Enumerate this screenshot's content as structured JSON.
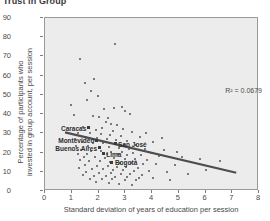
{
  "chart_title": "Trust in Group",
  "axes": {
    "x_label": "Standard deviation of years of education per session",
    "y_label_line1": "Percentage of participants who",
    "y_label_line2": "invested in group account, per session",
    "x_ticks": [
      "0",
      "1",
      "2",
      "3",
      "4",
      "5",
      "6",
      "7",
      "8"
    ],
    "y_ticks": [
      "0",
      "10",
      "20",
      "30",
      "40",
      "50",
      "60",
      "70",
      "80",
      "90"
    ]
  },
  "annotation": {
    "r_squared": "R² = 0.0679"
  },
  "cities": [
    {
      "name": "Caracas",
      "label_side": "left",
      "x": 1.62,
      "y": 33.0
    },
    {
      "name": "Montevideo",
      "label_side": "left",
      "x": 1.92,
      "y": 26.5
    },
    {
      "name": "San José",
      "label_side": "right",
      "x": 2.62,
      "y": 24.5
    },
    {
      "name": "Buenos Aires",
      "label_side": "left",
      "x": 2.02,
      "y": 22.5
    },
    {
      "name": "Lima",
      "label_side": "right",
      "x": 2.18,
      "y": 19.5
    },
    {
      "name": "Bogotá",
      "label_side": "right",
      "x": 2.5,
      "y": 15.0
    }
  ],
  "colors": {
    "plot_background": "#ececec",
    "plot_border": "#9a9a9a",
    "dot": "#555555",
    "trend_line": "#4d4d4d",
    "text": "#4a4a4a",
    "title_text": "#3a3a3a"
  },
  "chart_data": {
    "type": "scatter",
    "title": "Trust in Group",
    "xlabel": "Standard deviation of years of education per session",
    "ylabel": "Percentage of participants who invested in group account, per session",
    "xlim": [
      0,
      8
    ],
    "ylim": [
      0,
      90
    ],
    "x_ticks": [
      0,
      1,
      2,
      3,
      4,
      5,
      6,
      7,
      8
    ],
    "y_ticks": [
      0,
      10,
      20,
      30,
      40,
      50,
      60,
      70,
      80,
      90
    ],
    "grid": false,
    "legend": "none",
    "r_squared": 0.0679,
    "trendline": {
      "type": "linear",
      "x_start": 0.75,
      "y_start": 30.5,
      "x_end": 7.15,
      "y_end": 9.5
    },
    "points": [
      [
        2.62,
        76.5
      ],
      [
        1.32,
        68.5
      ],
      [
        1.85,
        58.5
      ],
      [
        1.48,
        56.0
      ],
      [
        1.72,
        52.0
      ],
      [
        1.98,
        49.5
      ],
      [
        1.58,
        47.5
      ],
      [
        0.96,
        45.0
      ],
      [
        2.58,
        43.0
      ],
      [
        2.22,
        42.5
      ],
      [
        2.98,
        41.5
      ],
      [
        3.18,
        40.0
      ],
      [
        1.08,
        39.5
      ],
      [
        1.78,
        39.0
      ],
      [
        2.02,
        38.5
      ],
      [
        2.35,
        38.0
      ],
      [
        2.28,
        36.0
      ],
      [
        2.45,
        35.0
      ],
      [
        1.62,
        33.0
      ],
      [
        2.7,
        34.5
      ],
      [
        1.42,
        33.5
      ],
      [
        2.12,
        33.0
      ],
      [
        2.92,
        32.0
      ],
      [
        1.9,
        31.5
      ],
      [
        2.55,
        31.0
      ],
      [
        3.25,
        30.5
      ],
      [
        1.25,
        30.0
      ],
      [
        1.68,
        30.0
      ],
      [
        2.08,
        29.5
      ],
      [
        2.42,
        29.0
      ],
      [
        2.85,
        28.5
      ],
      [
        3.55,
        28.0
      ],
      [
        1.52,
        28.0
      ],
      [
        1.95,
        27.5
      ],
      [
        2.32,
        27.0
      ],
      [
        1.92,
        26.5
      ],
      [
        2.65,
        26.5
      ],
      [
        3.05,
        26.0
      ],
      [
        4.02,
        25.5
      ],
      [
        1.38,
        25.5
      ],
      [
        1.8,
        25.0
      ],
      [
        2.18,
        25.0
      ],
      [
        2.62,
        24.5
      ],
      [
        2.95,
        24.0
      ],
      [
        3.42,
        24.0
      ],
      [
        1.15,
        23.5
      ],
      [
        1.6,
        23.5
      ],
      [
        2.02,
        22.5
      ],
      [
        2.38,
        23.0
      ],
      [
        2.78,
        22.5
      ],
      [
        3.15,
        22.0
      ],
      [
        3.72,
        22.0
      ],
      [
        4.45,
        21.5
      ],
      [
        1.35,
        21.5
      ],
      [
        1.72,
        21.0
      ],
      [
        2.1,
        21.0
      ],
      [
        2.48,
        20.5
      ],
      [
        2.88,
        20.5
      ],
      [
        3.28,
        20.0
      ],
      [
        3.95,
        20.0
      ],
      [
        1.22,
        19.5
      ],
      [
        1.58,
        19.5
      ],
      [
        2.18,
        19.5
      ],
      [
        2.3,
        19.0
      ],
      [
        2.72,
        19.0
      ],
      [
        3.08,
        18.5
      ],
      [
        3.58,
        18.5
      ],
      [
        4.28,
        18.0
      ],
      [
        5.12,
        17.5
      ],
      [
        1.45,
        17.5
      ],
      [
        1.88,
        17.5
      ],
      [
        2.25,
        17.0
      ],
      [
        2.58,
        17.0
      ],
      [
        2.98,
        16.5
      ],
      [
        3.38,
        16.5
      ],
      [
        3.82,
        16.0
      ],
      [
        1.3,
        16.0
      ],
      [
        1.65,
        15.5
      ],
      [
        2.05,
        15.5
      ],
      [
        2.5,
        15.0
      ],
      [
        2.42,
        15.0
      ],
      [
        2.82,
        14.5
      ],
      [
        3.22,
        14.5
      ],
      [
        3.65,
        14.0
      ],
      [
        4.15,
        14.0
      ],
      [
        4.85,
        13.5
      ],
      [
        1.5,
        13.5
      ],
      [
        1.95,
        13.0
      ],
      [
        2.35,
        13.0
      ],
      [
        2.68,
        12.5
      ],
      [
        3.02,
        12.5
      ],
      [
        3.48,
        12.0
      ],
      [
        1.28,
        12.0
      ],
      [
        1.75,
        11.5
      ],
      [
        2.15,
        11.5
      ],
      [
        2.55,
        11.0
      ],
      [
        2.92,
        11.0
      ],
      [
        3.32,
        10.5
      ],
      [
        3.88,
        10.5
      ],
      [
        4.55,
        10.0
      ],
      [
        1.55,
        10.0
      ],
      [
        2.0,
        9.5
      ],
      [
        2.45,
        9.5
      ],
      [
        2.85,
        9.0
      ],
      [
        3.18,
        9.0
      ],
      [
        3.62,
        8.5
      ],
      [
        1.42,
        8.5
      ],
      [
        1.82,
        8.0
      ],
      [
        2.28,
        8.0
      ],
      [
        2.62,
        7.5
      ],
      [
        3.08,
        7.5
      ],
      [
        3.52,
        7.0
      ],
      [
        4.05,
        7.0
      ],
      [
        1.68,
        6.5
      ],
      [
        2.12,
        6.0
      ],
      [
        2.52,
        6.0
      ],
      [
        2.98,
        5.5
      ],
      [
        3.42,
        5.5
      ],
      [
        1.92,
        4.5
      ],
      [
        2.38,
        4.0
      ],
      [
        2.78,
        3.5
      ],
      [
        3.25,
        3.0
      ],
      [
        5.78,
        16.5
      ],
      [
        6.55,
        15.5
      ],
      [
        4.68,
        5.5
      ],
      [
        5.35,
        9.0
      ],
      [
        4.92,
        20.5
      ],
      [
        3.78,
        30.0
      ],
      [
        4.38,
        27.5
      ],
      [
        2.88,
        43.5
      ],
      [
        1.12,
        27.0
      ],
      [
        6.02,
        11.0
      ]
    ]
  }
}
